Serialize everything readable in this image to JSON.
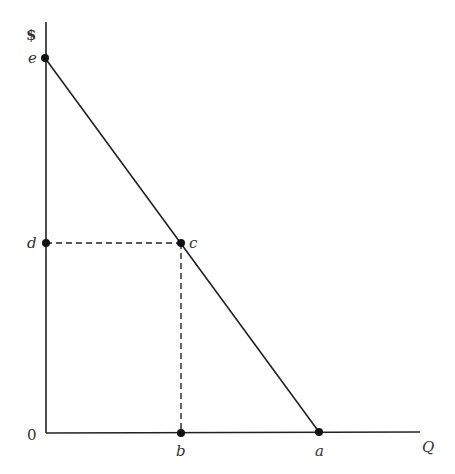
{
  "diagram": {
    "y_axis_label": "$",
    "x_axis_label": "Q",
    "origin_label": "0",
    "points": {
      "e": {
        "label": "e"
      },
      "d": {
        "label": "d"
      },
      "c": {
        "label": "c"
      },
      "b": {
        "label": "b"
      },
      "a": {
        "label": "a"
      }
    },
    "colors": {
      "line": "#222222",
      "text": "#333333"
    }
  }
}
